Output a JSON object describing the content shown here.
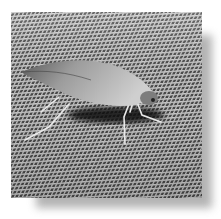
{
  "image": {
    "subject": "moth-like insect resting on a wire mesh screen",
    "style": "grayscale photograph with drop shadow",
    "colors": {
      "background": "#ffffff",
      "shadow": "#9a9a9a",
      "mesh_light": "#d8d8d8",
      "mesh_dark": "#3a3a3a",
      "insect_body": "#b5b5b5",
      "insect_shadow": "#1a1a1a"
    },
    "alt": "Insect on mesh screen"
  }
}
